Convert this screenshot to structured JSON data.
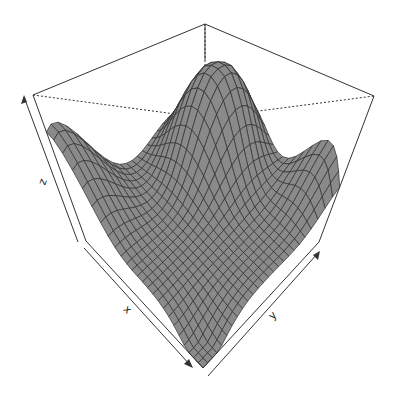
{
  "chart_data": {
    "type": "surface",
    "title": "",
    "xlabel": "x",
    "ylabel": "y",
    "zlabel": "z",
    "grid": "wireframe mesh on surface, 3D bounding box with hidden edges dotted",
    "view": {
      "theta_deg": 35,
      "phi_deg": 30,
      "box": true,
      "ticks": false
    },
    "mesh": {
      "nx": 25,
      "ny": 25
    },
    "surface_description": "Smooth surface with a tall peak near the back-centre, a raised ridge at the left (x-min) corner, a raised lip along the right (y-max) edge and a deep valley near the front (x-max, y-min) corner",
    "features": [
      {
        "name": "peak",
        "x": 0.35,
        "y": 0.75,
        "z": 1.0
      },
      {
        "name": "left-ridge",
        "x": 0.0,
        "y": 0.1,
        "z": 0.72
      },
      {
        "name": "right-lip",
        "x": 0.85,
        "y": 1.0,
        "z": 0.55
      },
      {
        "name": "valley",
        "x": 0.95,
        "y": 0.05,
        "z": 0.0
      }
    ],
    "colors": {
      "surface": "#8a8a8a",
      "mesh": "#2e2e2e",
      "box": "#333333"
    }
  },
  "axes": {
    "x_label": "x",
    "y_label": "y",
    "z_label": "z"
  }
}
